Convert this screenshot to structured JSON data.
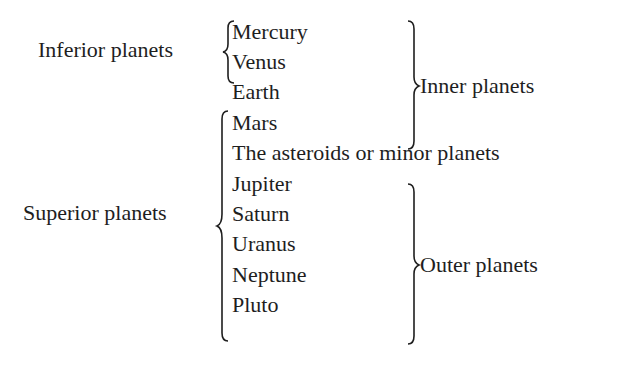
{
  "classification": {
    "group_left": [
      {
        "label": "Inferior planets",
        "members": [
          "Mercury",
          "Venus"
        ]
      },
      {
        "label": "Superior planets",
        "members": [
          "Mars",
          "The asteroids or minor planets",
          "Jupiter",
          "Saturn",
          "Uranus",
          "Neptune",
          "Pluto"
        ]
      }
    ],
    "group_right": [
      {
        "label": "Inner planets",
        "members": [
          "Mercury",
          "Venus",
          "Earth",
          "Mars"
        ]
      },
      {
        "label": "Outer planets",
        "members": [
          "Jupiter",
          "Saturn",
          "Uranus",
          "Neptune",
          "Pluto"
        ]
      }
    ]
  },
  "labels": {
    "inferior": "Inferior planets",
    "superior": "Superior planets",
    "inner": "Inner planets",
    "outer": "Outer planets"
  },
  "bodies": [
    "Mercury",
    "Venus",
    "Earth",
    "Mars",
    "The asteroids or minor planets",
    "Jupiter",
    "Saturn",
    "Uranus",
    "Neptune",
    "Pluto"
  ]
}
